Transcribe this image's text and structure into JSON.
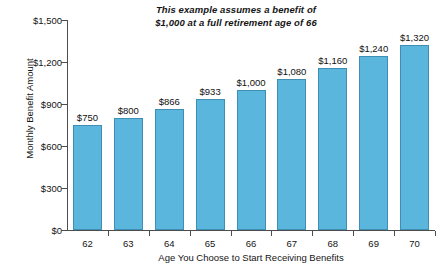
{
  "chart_data": {
    "type": "bar",
    "title": "",
    "annotation": "This example assumes a benefit of $1,000 at a full retirement age of 66",
    "annotation_line1": "This example assumes a benefit of",
    "annotation_line2": "$1,000 at a full retirement age of 66",
    "xlabel": "Age You Choose to Start Receiving Benefits",
    "ylabel": "Monthly Benefit Amount",
    "categories": [
      "62",
      "63",
      "64",
      "65",
      "66",
      "67",
      "68",
      "69",
      "70"
    ],
    "values": [
      750,
      800,
      866,
      933,
      1000,
      1080,
      1160,
      1240,
      1320
    ],
    "value_labels": [
      "$750",
      "$800",
      "$866",
      "$933",
      "$1,000",
      "$1,080",
      "$1,160",
      "$1,240",
      "$1,320"
    ],
    "ylim": [
      0,
      1500
    ],
    "ytick_values": [
      0,
      300,
      600,
      900,
      1200,
      1500
    ],
    "ytick_labels": [
      "$0",
      "$300",
      "$600",
      "$900",
      "$1,200",
      "$1,500"
    ],
    "grid": false,
    "legend": null,
    "bar_color": "#5bb6dd",
    "bar_border_color": "#3f8fb5",
    "axis_color": "#4d4d4d",
    "background": "#ffffff"
  }
}
